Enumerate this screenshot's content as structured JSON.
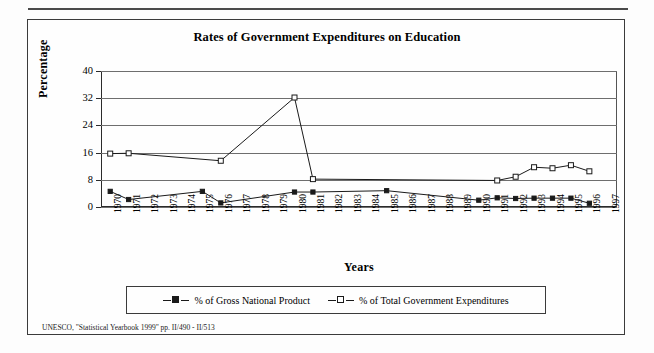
{
  "figure": {
    "title": "Rates of Government Expenditures on Education",
    "footnote": "UNESCO, \"Statistical Yearbook 1999\" pp. II/490 - II/513"
  },
  "legend": {
    "entries": [
      {
        "label": "% of Gross National Product",
        "marker": "filled-square",
        "color": "#1a1a1a"
      },
      {
        "label": "% of Total Government Expenditures",
        "marker": "open-square",
        "color": "#1a1a1a"
      }
    ]
  },
  "chart_data": {
    "type": "line",
    "title": "Rates of Government Expenditures on Education",
    "xlabel": "Years",
    "ylabel": "Percentage",
    "ylim": [
      0,
      40
    ],
    "yticks": [
      0,
      8,
      16,
      24,
      32,
      40
    ],
    "grid": true,
    "legend_position": "bottom",
    "categories": [
      "1970",
      "1971",
      "1972",
      "1973",
      "1974",
      "1975",
      "1976",
      "1977",
      "1978",
      "1979",
      "1980",
      "1981",
      "1982",
      "1983",
      "1984",
      "1985",
      "1986",
      "1987",
      "1988",
      "1989",
      "1990",
      "1991",
      "1992",
      "1993",
      "1994",
      "1995",
      "1996",
      "1997"
    ],
    "series": [
      {
        "name": "% of Gross National Product",
        "marker": "filled-square",
        "points": [
          {
            "x": "1970",
            "y": 4.6
          },
          {
            "x": "1971",
            "y": 2.2
          },
          {
            "x": "1975",
            "y": 4.6
          },
          {
            "x": "1976",
            "y": 1.2
          },
          {
            "x": "1980",
            "y": 4.4
          },
          {
            "x": "1981",
            "y": 4.4
          },
          {
            "x": "1985",
            "y": 4.8
          },
          {
            "x": "1990",
            "y": 2.0
          },
          {
            "x": "1991",
            "y": 2.7
          },
          {
            "x": "1992",
            "y": 2.5
          },
          {
            "x": "1993",
            "y": 2.6
          },
          {
            "x": "1994",
            "y": 2.6
          },
          {
            "x": "1995",
            "y": 2.6
          },
          {
            "x": "1996",
            "y": 1.1
          }
        ]
      },
      {
        "name": "% of Total Government Expenditures",
        "marker": "open-square",
        "points": [
          {
            "x": "1970",
            "y": 15.7
          },
          {
            "x": "1971",
            "y": 15.8
          },
          {
            "x": "1976",
            "y": 13.6
          },
          {
            "x": "1980",
            "y": 32.2
          },
          {
            "x": "1981",
            "y": 8.2
          },
          {
            "x": "1991",
            "y": 7.8
          },
          {
            "x": "1992",
            "y": 8.9
          },
          {
            "x": "1993",
            "y": 11.7
          },
          {
            "x": "1994",
            "y": 11.4
          },
          {
            "x": "1995",
            "y": 12.3
          },
          {
            "x": "1996",
            "y": 10.5
          }
        ]
      }
    ]
  }
}
